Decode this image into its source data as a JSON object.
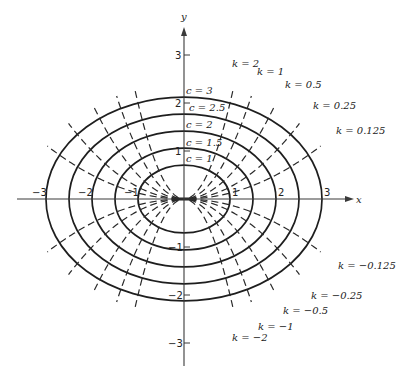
{
  "figure": {
    "axes": {
      "x_label": "x",
      "y_label": "y",
      "x_ticks": [
        {
          "value": -3,
          "label": "−3"
        },
        {
          "value": -2,
          "label": "−2"
        },
        {
          "value": -1,
          "label": "−1"
        },
        {
          "value": 1,
          "label": "1"
        },
        {
          "value": 2,
          "label": "2"
        },
        {
          "value": 3,
          "label": "3"
        }
      ],
      "y_ticks": [
        {
          "value": 3,
          "label": "3"
        },
        {
          "value": 2,
          "label": "2"
        },
        {
          "value": 1,
          "label": "1"
        },
        {
          "value": -1,
          "label": "−1"
        },
        {
          "value": -2,
          "label": "−2"
        },
        {
          "value": -3,
          "label": "−3"
        }
      ]
    },
    "ellipses": [
      {
        "c": 1,
        "label": "c = 1"
      },
      {
        "c": 1.5,
        "label": "c = 1.5"
      },
      {
        "c": 2,
        "label": "c = 2"
      },
      {
        "c": 2.5,
        "label": "c = 2.5"
      },
      {
        "c": 3,
        "label": "c = 3"
      }
    ],
    "trajectories": [
      {
        "k": 2,
        "label": "k = 2"
      },
      {
        "k": 1,
        "label": "k = 1"
      },
      {
        "k": 0.5,
        "label": "k = 0.5"
      },
      {
        "k": 0.25,
        "label": "k = 0.25"
      },
      {
        "k": 0.125,
        "label": "k = 0.125"
      },
      {
        "k": -0.125,
        "label": "k = −0.125"
      },
      {
        "k": -0.25,
        "label": "k = −0.25"
      },
      {
        "k": -0.5,
        "label": "k = −0.5"
      },
      {
        "k": -1,
        "label": "k = −1"
      },
      {
        "k": -2,
        "label": "k = −2"
      }
    ]
  }
}
